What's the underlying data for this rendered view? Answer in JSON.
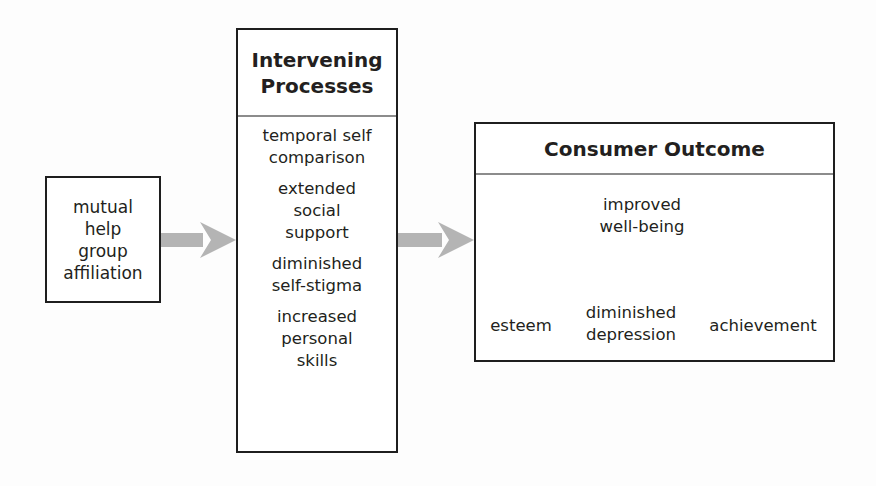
{
  "diagram": {
    "type": "flow",
    "colors": {
      "border": "#1e1e1e",
      "divider": "#8c8c8c",
      "arrow": "#b4b4b4",
      "text": "#231f20"
    },
    "input_box": {
      "label": "mutual\nhelp\ngroup\naffiliation"
    },
    "process_box": {
      "title": "Intervening\nProcesses",
      "items": [
        "temporal self\ncomparison",
        "extended\nsocial\nsupport",
        "diminished\nself-stigma",
        "increased\npersonal\nskills"
      ]
    },
    "outcome_box": {
      "title": "Consumer Outcome",
      "root": "improved\nwell-being",
      "branches": [
        "esteem",
        "diminished\ndepression",
        "achievement"
      ]
    },
    "edges": [
      {
        "from": "input_box",
        "to": "process_box"
      },
      {
        "from": "process_box",
        "to": "outcome_box"
      },
      {
        "from": "improved well-being",
        "to": "esteem"
      },
      {
        "from": "improved well-being",
        "to": "diminished depression"
      },
      {
        "from": "improved well-being",
        "to": "achievement"
      }
    ]
  }
}
